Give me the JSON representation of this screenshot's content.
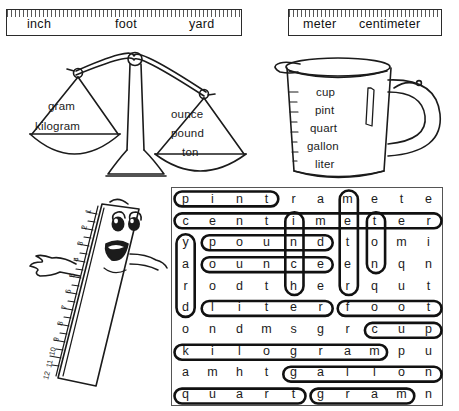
{
  "worksheet": {
    "title": "Measurement Word Search"
  },
  "header_boxes": [
    {
      "name": "customary-length-box",
      "words": [
        "inch",
        "foot",
        "yard"
      ]
    },
    {
      "name": "metric-length-box",
      "words": [
        "meter",
        "centimeter"
      ]
    }
  ],
  "balance_scale": {
    "name": "balance-scale",
    "left_pan_labels": [
      "gram",
      "kilogram"
    ],
    "right_pan_labels": [
      "ounce",
      "pound",
      "ton"
    ]
  },
  "measuring_cup": {
    "name": "measuring-cup",
    "labels": [
      "cup",
      "pint",
      "quart",
      "gallon",
      "liter"
    ]
  },
  "ruler_character": {
    "name": "ruler-character",
    "tick_numbers": [
      "1",
      "2",
      "3",
      "4",
      "5",
      "6",
      "7",
      "8",
      "9",
      "10",
      "11",
      "12"
    ]
  },
  "word_search": {
    "rows": 10,
    "cols": 10,
    "letters": [
      [
        "p",
        "i",
        "n",
        "t",
        "r",
        "a",
        "m",
        "e",
        "t",
        "e"
      ],
      [
        "c",
        "e",
        "n",
        "t",
        "i",
        "m",
        "e",
        "t",
        "e",
        "r"
      ],
      [
        "y",
        "p",
        "o",
        "u",
        "n",
        "d",
        "t",
        "o",
        "m",
        "i"
      ],
      [
        "a",
        "o",
        "u",
        "n",
        "c",
        "e",
        "e",
        "n",
        "q",
        "n"
      ],
      [
        "r",
        "o",
        "d",
        "t",
        "h",
        "e",
        "r",
        "q",
        "u",
        "t"
      ],
      [
        "d",
        "l",
        "i",
        "t",
        "e",
        "r",
        "f",
        "o",
        "o",
        "t"
      ],
      [
        "o",
        "n",
        "d",
        "m",
        "s",
        "g",
        "r",
        "c",
        "u",
        "p"
      ],
      [
        "k",
        "i",
        "l",
        "o",
        "g",
        "r",
        "a",
        "m",
        "p",
        "u"
      ],
      [
        "a",
        "m",
        "h",
        "t",
        "g",
        "a",
        "l",
        "l",
        "o",
        "n"
      ],
      [
        "q",
        "u",
        "a",
        "r",
        "t",
        "g",
        "r",
        "a",
        "m",
        "n"
      ]
    ],
    "found_words": [
      {
        "word": "pint",
        "row": 0,
        "col": 0,
        "len": 4,
        "dir": "h"
      },
      {
        "word": "centimeter",
        "row": 1,
        "col": 0,
        "len": 10,
        "dir": "h"
      },
      {
        "word": "pound",
        "row": 2,
        "col": 1,
        "len": 5,
        "dir": "h"
      },
      {
        "word": "ounce",
        "row": 3,
        "col": 1,
        "len": 5,
        "dir": "h"
      },
      {
        "word": "liter",
        "row": 5,
        "col": 1,
        "len": 5,
        "dir": "h"
      },
      {
        "word": "foot",
        "row": 5,
        "col": 6,
        "len": 4,
        "dir": "h"
      },
      {
        "word": "cup",
        "row": 6,
        "col": 7,
        "len": 3,
        "dir": "h"
      },
      {
        "word": "kilogram",
        "row": 7,
        "col": 0,
        "len": 8,
        "dir": "h"
      },
      {
        "word": "gallon",
        "row": 8,
        "col": 4,
        "len": 6,
        "dir": "h"
      },
      {
        "word": "quart",
        "row": 9,
        "col": 0,
        "len": 5,
        "dir": "h"
      },
      {
        "word": "gram",
        "row": 9,
        "col": 5,
        "len": 4,
        "dir": "h"
      },
      {
        "word": "yard",
        "row": 2,
        "col": 0,
        "len": 4,
        "dir": "v"
      },
      {
        "word": "inch",
        "row": 1,
        "col": 4,
        "len": 4,
        "dir": "v"
      },
      {
        "word": "meter",
        "row": 0,
        "col": 6,
        "len": 5,
        "dir": "v"
      },
      {
        "word": "ton",
        "row": 1,
        "col": 7,
        "len": 3,
        "dir": "v"
      }
    ]
  },
  "colors": {
    "ink": "#1b1b1b",
    "loop": "#111111",
    "box_border": "#2b2b2b",
    "paper": "#ffffff"
  }
}
